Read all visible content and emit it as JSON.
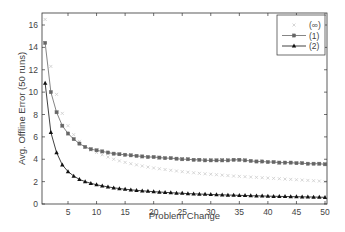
{
  "chart_data": {
    "type": "line",
    "title": "",
    "xlabel": "Problem Change",
    "ylabel": "Avg. Offline Error (50 runs)",
    "xlim": [
      0,
      50.3
    ],
    "ylim": [
      0,
      17
    ],
    "xticks": [
      5,
      10,
      15,
      20,
      25,
      30,
      35,
      40,
      45,
      50
    ],
    "yticks": [
      0,
      2,
      4,
      6,
      8,
      10,
      12,
      14,
      16
    ],
    "grid": false,
    "legend_position": "upper right",
    "x": [
      1,
      2,
      3,
      4,
      5,
      6,
      7,
      8,
      9,
      10,
      11,
      12,
      13,
      14,
      15,
      16,
      17,
      18,
      19,
      20,
      21,
      22,
      23,
      24,
      25,
      26,
      27,
      28,
      29,
      30,
      31,
      32,
      33,
      34,
      35,
      36,
      37,
      38,
      39,
      40,
      41,
      42,
      43,
      44,
      45,
      46,
      47,
      48,
      49,
      50
    ],
    "series": [
      {
        "name": "(∞)",
        "marker": "x",
        "color": "#cccccc",
        "line": false,
        "values": [
          16.5,
          12.3,
          9.8,
          8.1,
          7.0,
          6.2,
          5.6,
          5.1,
          4.8,
          4.6,
          4.4,
          4.2,
          4.0,
          3.85,
          3.72,
          3.6,
          3.5,
          3.4,
          3.3,
          3.22,
          3.15,
          3.08,
          3.01,
          2.95,
          2.89,
          2.84,
          2.79,
          2.74,
          2.7,
          2.66,
          2.62,
          2.58,
          2.54,
          2.5,
          2.47,
          2.44,
          2.41,
          2.38,
          2.35,
          2.32,
          2.29,
          2.26,
          2.23,
          2.2,
          2.17,
          2.14,
          2.11,
          2.08,
          2.05,
          2.0
        ]
      },
      {
        "name": "(1)",
        "marker": "square",
        "color": "#666666",
        "line": true,
        "values": [
          14.4,
          10.0,
          8.2,
          7.0,
          6.3,
          5.8,
          5.4,
          5.1,
          4.9,
          4.8,
          4.7,
          4.6,
          4.5,
          4.45,
          4.4,
          4.35,
          4.3,
          4.25,
          4.2,
          4.2,
          4.15,
          4.1,
          4.1,
          4.05,
          4.0,
          4.0,
          3.95,
          3.95,
          3.9,
          3.9,
          3.9,
          3.9,
          3.9,
          3.95,
          3.95,
          3.9,
          3.85,
          3.8,
          3.8,
          3.75,
          3.75,
          3.7,
          3.7,
          3.7,
          3.65,
          3.65,
          3.6,
          3.6,
          3.6,
          3.55
        ]
      },
      {
        "name": "(2)",
        "marker": "triangle",
        "color": "#111111",
        "line": true,
        "values": [
          10.8,
          6.4,
          4.6,
          3.5,
          2.9,
          2.5,
          2.2,
          2.0,
          1.85,
          1.72,
          1.62,
          1.53,
          1.45,
          1.38,
          1.32,
          1.27,
          1.22,
          1.18,
          1.14,
          1.1,
          1.07,
          1.04,
          1.01,
          0.98,
          0.96,
          0.93,
          0.91,
          0.89,
          0.87,
          0.85,
          0.83,
          0.82,
          0.8,
          0.79,
          0.77,
          0.76,
          0.74,
          0.73,
          0.72,
          0.7,
          0.69,
          0.68,
          0.67,
          0.66,
          0.65,
          0.64,
          0.63,
          0.62,
          0.61,
          0.6
        ]
      }
    ]
  },
  "labels": {
    "xlabel": "Problem Change",
    "ylabel": "Avg. Offline Error (50 runs)",
    "legend": [
      "(∞)",
      "(1)",
      "(2)"
    ]
  }
}
